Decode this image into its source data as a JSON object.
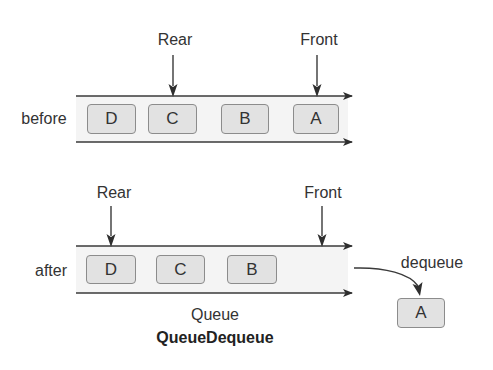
{
  "diagram": {
    "title": "QueueDequeue",
    "subtitle": "Queue",
    "colors": {
      "line": "#3a3a3a",
      "band_fill": "#f4f4f4",
      "box_fill": "#e2e2e2",
      "box_border": "#8c8c8c",
      "text": "#333333"
    },
    "before": {
      "row_label": "before",
      "rear_label": "Rear",
      "front_label": "Front",
      "items": [
        "D",
        "C",
        "B",
        "A"
      ]
    },
    "after": {
      "row_label": "after",
      "rear_label": "Rear",
      "front_label": "Front",
      "items": [
        "D",
        "C",
        "B"
      ],
      "operation_label": "dequeue",
      "removed_item": "A"
    }
  }
}
